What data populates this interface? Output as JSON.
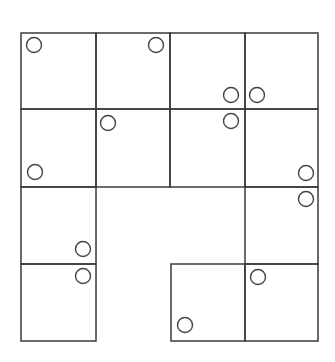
{
  "diagram": {
    "type": "grid-with-circle-markers",
    "stroke_color": "#3a3a3a",
    "marker_color": "#444444",
    "marker_radius": 7.5,
    "cells": [
      {
        "id": "r1c1",
        "x": 21,
        "y": 33,
        "w": 75,
        "h": 76
      },
      {
        "id": "r1c2",
        "x": 96,
        "y": 33,
        "w": 74,
        "h": 76
      },
      {
        "id": "r1c3",
        "x": 170,
        "y": 33,
        "w": 75,
        "h": 76
      },
      {
        "id": "r1c4",
        "x": 245,
        "y": 33,
        "w": 73,
        "h": 76
      },
      {
        "id": "r2c1",
        "x": 21,
        "y": 109,
        "w": 75,
        "h": 78
      },
      {
        "id": "r2c2",
        "x": 96,
        "y": 109,
        "w": 74,
        "h": 78
      },
      {
        "id": "r2c3",
        "x": 170,
        "y": 109,
        "w": 75,
        "h": 78
      },
      {
        "id": "r2c4",
        "x": 245,
        "y": 109,
        "w": 73,
        "h": 78
      },
      {
        "id": "r3c1",
        "x": 21,
        "y": 187,
        "w": 75,
        "h": 77
      },
      {
        "id": "r3c4",
        "x": 245,
        "y": 187,
        "w": 73,
        "h": 77
      },
      {
        "id": "r4c1",
        "x": 21,
        "y": 264,
        "w": 75,
        "h": 77
      },
      {
        "id": "r4c3",
        "x": 171,
        "y": 264,
        "w": 74,
        "h": 77
      },
      {
        "id": "r4c4",
        "x": 245,
        "y": 264,
        "w": 73,
        "h": 77
      }
    ],
    "markers": [
      {
        "cell": "r1c1",
        "cx": 34,
        "cy": 45
      },
      {
        "cell": "r1c2",
        "cx": 156,
        "cy": 45
      },
      {
        "cell": "r1c3",
        "cx": 231,
        "cy": 95
      },
      {
        "cell": "r1c4",
        "cx": 257,
        "cy": 95
      },
      {
        "cell": "r2c2",
        "cx": 108,
        "cy": 123
      },
      {
        "cell": "r2c3",
        "cx": 231,
        "cy": 121
      },
      {
        "cell": "r2c1",
        "cx": 35,
        "cy": 172
      },
      {
        "cell": "r2c4",
        "cx": 306,
        "cy": 173
      },
      {
        "cell": "r3c4",
        "cx": 306,
        "cy": 199
      },
      {
        "cell": "r3c1",
        "cx": 83,
        "cy": 249
      },
      {
        "cell": "r4c1",
        "cx": 83,
        "cy": 276
      },
      {
        "cell": "r4c4",
        "cx": 258,
        "cy": 277
      },
      {
        "cell": "r4c3",
        "cx": 185,
        "cy": 325
      }
    ]
  }
}
